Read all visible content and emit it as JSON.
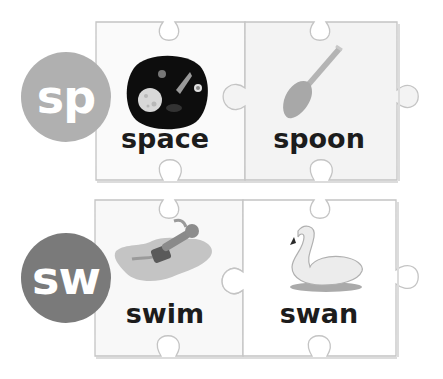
{
  "rows": [
    {
      "blend": "sp",
      "blend_color": "#b0b0b0",
      "pieces": [
        {
          "word": "space",
          "picture": "space-scene"
        },
        {
          "word": "spoon",
          "picture": "spoon"
        }
      ]
    },
    {
      "blend": "sw",
      "blend_color": "#7a7a7a",
      "pieces": [
        {
          "word": "swim",
          "picture": "swimmer"
        },
        {
          "word": "swan",
          "picture": "swan"
        }
      ]
    }
  ],
  "colors": {
    "piece_border": "#c4c4c4",
    "piece_fill_left": "#f9f9f9",
    "piece_fill_right": "#f4f4f4",
    "text": "#1c1c1c"
  }
}
